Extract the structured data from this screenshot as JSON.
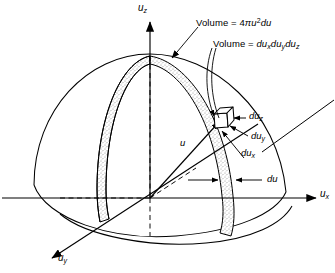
{
  "figure": {
    "kind": "velocity-space-hemisphere",
    "background": "#ffffff",
    "line_color": "#000000",
    "stipple_color": "#8a8a8a"
  },
  "axes": {
    "z": {
      "label_text": "u",
      "sub": "z",
      "name": "u_z"
    },
    "x": {
      "label_text": "u",
      "sub": "x",
      "name": "u_x"
    },
    "y": {
      "label_text": "u",
      "sub": "y",
      "name": "u_y"
    }
  },
  "annotations": {
    "shell": {
      "prefix": "Volume  =  4",
      "pi": "π",
      "u": "u",
      "exp": "2",
      "tail": "du"
    },
    "cube": {
      "prefix": "Volume  =  ",
      "du1": "du",
      "sub1": "x",
      "du2": "du",
      "sub2": "y",
      "du3": "du",
      "sub3": "z"
    }
  },
  "labels": {
    "radius": {
      "text": "u"
    },
    "du_z": {
      "text": "du",
      "sub": "z"
    },
    "du_y": {
      "text": "du",
      "sub": "y"
    },
    "du_x": {
      "text": "du",
      "sub": "x"
    },
    "du": {
      "text": "du"
    }
  }
}
